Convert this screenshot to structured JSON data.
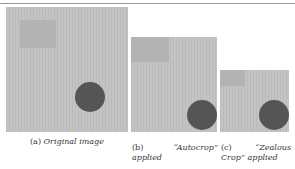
{
  "figure": {
    "panels": [
      {
        "id": "a",
        "label": "(a)",
        "caption": "Original image"
      },
      {
        "id": "b",
        "label": "(b)",
        "caption_line1": "“Autocrop”",
        "caption_line2": "applied"
      },
      {
        "id": "c",
        "label": "(c)",
        "caption_line1": "“Zealous",
        "caption_line2": "Crop” applied"
      }
    ],
    "colors": {
      "background_gray": "#c2c2c2",
      "square_gray": "#b3b3b3",
      "disc_gray": "#555555"
    }
  }
}
